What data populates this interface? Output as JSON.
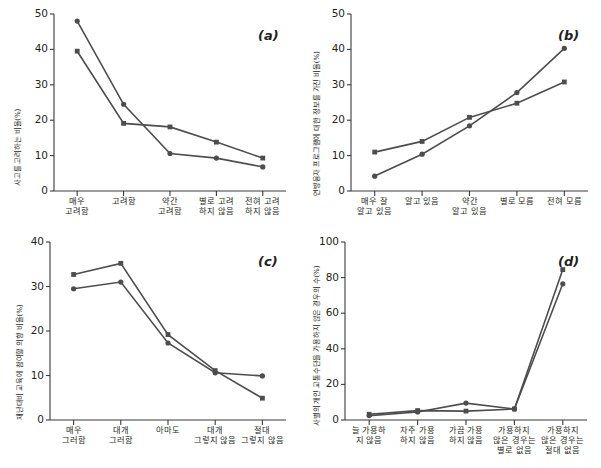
{
  "figure": {
    "type": "multi-panel-line-chart",
    "panels_count": 4,
    "line_color": "#4d4d4d",
    "text_color": "#231f20",
    "background": "#ffffff"
  },
  "chart_data": [
    {
      "type": "line",
      "panel": "(a)",
      "title": "",
      "xlabel": "",
      "ylabel": "사고를 고려하는 비율(%)",
      "categories": [
        "매우\n고려함",
        "고려함",
        "약간\n고려함",
        "별로 고려\n하지 않음",
        "전혀 고려\n하지 않음"
      ],
      "yticks": [
        0,
        10,
        20,
        30,
        40,
        50
      ],
      "ylim": [
        0,
        50
      ],
      "grid": false,
      "legend": "none",
      "series": [
        {
          "name": "series-circle",
          "marker": "circle",
          "values": [
            48.0,
            24.5,
            10.6,
            9.3,
            6.8
          ]
        },
        {
          "name": "series-square",
          "marker": "square",
          "values": [
            39.5,
            19.1,
            18.1,
            13.8,
            9.3
          ]
        }
      ]
    },
    {
      "type": "line",
      "panel": "(b)",
      "title": "",
      "xlabel": "",
      "ylabel": "연방융자 프로그램에 대한 정보를 가진 비율(%)",
      "categories": [
        "매우 잘\n알고 있음",
        "알고 있음",
        "약간\n알고 있음",
        "별로 모름",
        "전혀 모름"
      ],
      "yticks": [
        0,
        10,
        20,
        30,
        40,
        50
      ],
      "ylim": [
        0,
        50
      ],
      "grid": false,
      "legend": "none",
      "series": [
        {
          "name": "series-circle",
          "marker": "circle",
          "values": [
            4.2,
            10.4,
            18.4,
            27.8,
            40.3
          ]
        },
        {
          "name": "series-square",
          "marker": "square",
          "values": [
            11.0,
            14.0,
            20.8,
            24.8,
            30.8
          ]
        }
      ]
    },
    {
      "type": "line",
      "panel": "(c)",
      "title": "",
      "xlabel": "",
      "ylabel": "재난대비 교육에 참여할 의향 비율(%)",
      "categories": [
        "매우\n그러함",
        "대개\n그러함",
        "아마도",
        "대개\n그렇지 않음",
        "절대\n그렇지 않음"
      ],
      "yticks": [
        0,
        10,
        20,
        30,
        40
      ],
      "ylim": [
        0,
        40
      ],
      "grid": false,
      "legend": "none",
      "series": [
        {
          "name": "series-circle",
          "marker": "circle",
          "values": [
            29.5,
            31.0,
            17.3,
            10.6,
            9.9
          ]
        },
        {
          "name": "series-square",
          "marker": "square",
          "values": [
            32.7,
            35.2,
            19.2,
            11.1,
            4.9
          ]
        }
      ]
    },
    {
      "type": "line",
      "panel": "(d)",
      "title": "",
      "xlabel": "",
      "ylabel": "사별의 개인 교통수단을 가용하지 않은 경우의 수(%)",
      "categories": [
        "늘 가용하\n지 않음",
        "자주 가용\n하지 않음",
        "가끔 가용\n하지 않음",
        "가용하지\n않은 경우는\n별로 없음",
        "가용하지\n않은 경우는\n절대 없음"
      ],
      "yticks": [
        0,
        20,
        40,
        60,
        80,
        100
      ],
      "ylim": [
        0,
        100
      ],
      "grid": false,
      "legend": "none",
      "series": [
        {
          "name": "series-circle",
          "marker": "circle",
          "values": [
            2.5,
            4.5,
            9.5,
            6.2,
            76.5
          ]
        },
        {
          "name": "series-square",
          "marker": "square",
          "values": [
            3.2,
            5.3,
            5.0,
            6.2,
            84.5
          ]
        }
      ]
    }
  ]
}
